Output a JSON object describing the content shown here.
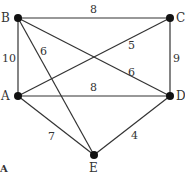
{
  "diagram": {
    "type": "weighted-graph",
    "nodes": [
      {
        "id": "A",
        "label": "A",
        "x": 18,
        "y": 96
      },
      {
        "id": "B",
        "label": "B",
        "x": 18,
        "y": 18
      },
      {
        "id": "C",
        "label": "C",
        "x": 170,
        "y": 18
      },
      {
        "id": "D",
        "label": "D",
        "x": 170,
        "y": 96
      },
      {
        "id": "E",
        "label": "E",
        "x": 94,
        "y": 155
      }
    ],
    "edges": [
      {
        "from": "B",
        "to": "C",
        "weight": "8"
      },
      {
        "from": "B",
        "to": "A",
        "weight": "10"
      },
      {
        "from": "B",
        "to": "E",
        "weight": "6"
      },
      {
        "from": "B",
        "to": "D",
        "weight": "6"
      },
      {
        "from": "A",
        "to": "C",
        "weight": "5"
      },
      {
        "from": "A",
        "to": "D",
        "weight": "8"
      },
      {
        "from": "C",
        "to": "D",
        "weight": "9"
      },
      {
        "from": "A",
        "to": "E",
        "weight": "7"
      },
      {
        "from": "D",
        "to": "E",
        "weight": "4"
      }
    ],
    "corner_label": "A"
  }
}
